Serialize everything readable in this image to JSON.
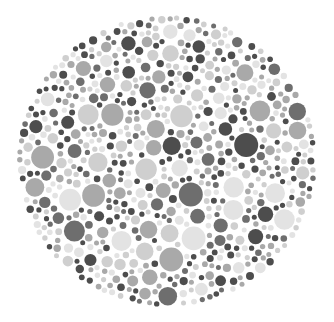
{
  "image": {
    "type": "ishihara-style dot plate (grayscale)",
    "width": 334,
    "height": 322,
    "background": "#ffffff"
  },
  "plate": {
    "center_x": 167,
    "center_y": 161,
    "radius_x": 150,
    "radius_y": 146,
    "dot_count_target": 900,
    "min_radius": 2.5,
    "max_radius": 12,
    "seed": 7,
    "palette": [
      "#4d4d4d",
      "#6e6e6e",
      "#a9a9a9",
      "#cfcfcf",
      "#e3e3e3"
    ],
    "palette_weights": [
      0.22,
      0.14,
      0.24,
      0.22,
      0.18
    ]
  }
}
